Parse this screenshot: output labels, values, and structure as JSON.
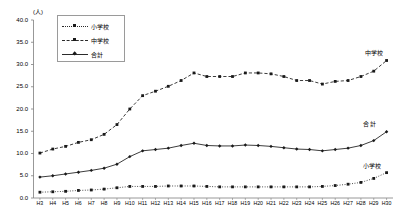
{
  "chart_data": {
    "type": "line",
    "title": "",
    "unit_label": "(人)",
    "xlabel": "",
    "ylabel": "",
    "ylim": [
      0.0,
      40.0
    ],
    "ytick_step": 5.0,
    "ytick_labels": [
      "40.0",
      "35.0",
      "30.0",
      "25.0",
      "20.0",
      "15.0",
      "10.0",
      "5.0",
      "0.0"
    ],
    "grid": false,
    "legend_position": "upper-left-inside",
    "categories": [
      "H3",
      "H4",
      "H5",
      "H6",
      "H7",
      "H8",
      "H9",
      "H10",
      "H11",
      "H12",
      "H13",
      "H14",
      "H15",
      "H16",
      "H17",
      "H18",
      "H19",
      "H20",
      "H21",
      "H22",
      "H23",
      "H24",
      "H25",
      "H26",
      "H27",
      "H28",
      "H29",
      "H30"
    ],
    "series": [
      {
        "name": "小学校",
        "marker": "square",
        "line_style": "dotted",
        "color": "#1a1a1a",
        "values": [
          1.3,
          1.4,
          1.5,
          1.7,
          1.8,
          2.0,
          2.3,
          2.6,
          2.6,
          2.6,
          2.7,
          2.7,
          2.7,
          2.6,
          2.5,
          2.5,
          2.5,
          2.5,
          2.5,
          2.5,
          2.5,
          2.5,
          2.6,
          2.8,
          3.1,
          3.5,
          4.4,
          5.7
        ]
      },
      {
        "name": "中学校",
        "marker": "square",
        "line_style": "dashed",
        "color": "#1a1a1a",
        "values": [
          10.1,
          11.0,
          11.6,
          12.5,
          13.1,
          14.3,
          16.5,
          20.0,
          23.0,
          24.0,
          25.1,
          26.4,
          28.1,
          27.3,
          27.3,
          27.3,
          28.1,
          28.1,
          27.9,
          27.3,
          26.4,
          26.4,
          25.6,
          26.2,
          26.4,
          27.3,
          28.5,
          30.9
        ]
      },
      {
        "name": "合計",
        "marker": "diamond",
        "line_style": "solid",
        "color": "#1a1a1a",
        "values": [
          4.7,
          5.0,
          5.4,
          5.8,
          6.2,
          6.7,
          7.6,
          9.3,
          10.6,
          10.9,
          11.2,
          11.8,
          12.3,
          11.8,
          11.7,
          11.7,
          11.9,
          11.8,
          11.6,
          11.3,
          11.0,
          10.9,
          10.6,
          10.9,
          11.2,
          11.8,
          12.9,
          14.9
        ]
      }
    ],
    "series_annotations": [
      {
        "text": "中学校",
        "series": "中学校"
      },
      {
        "text": "合 計",
        "series": "合計"
      },
      {
        "text": "小学校",
        "series": "小学校"
      }
    ],
    "legend_entries": [
      "小学校",
      "中学校",
      "合計"
    ]
  }
}
